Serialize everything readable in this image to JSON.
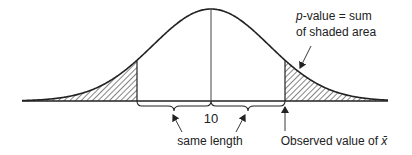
{
  "diagram": {
    "type": "normal-distribution-pvalue",
    "center_label": "10",
    "annotation_pvalue_line1_italic": "p",
    "annotation_pvalue_line1_rest": "-value = sum",
    "annotation_pvalue_line2": "of shaded area",
    "label_same_length": "same length",
    "label_observed_prefix": "Observed value of ",
    "label_observed_symbol": "x̄",
    "colors": {
      "stroke": "#222222",
      "hatch": "#333333",
      "background": "#ffffff"
    }
  }
}
